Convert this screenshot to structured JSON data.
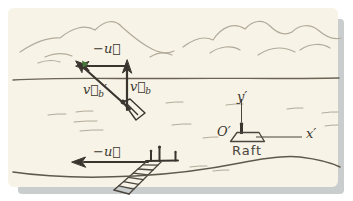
{
  "figure": {
    "colors": {
      "panel_bg": "#f7f3e7",
      "panel_shadow": "#c9cdcd",
      "ink_dark": "#3a362f",
      "ink_shore": "#6b6455",
      "ink_light": "#b3ab9a",
      "accent_green": "#47793b"
    }
  },
  "vector_triangle": {
    "neg_u_label": "−u⃗",
    "v_b_label_base": "v⃗",
    "v_b_label_sub": "b",
    "v_b_prime_label_base": "v⃗",
    "v_b_prime_label_sub": "b",
    "v_b_prime_label_prime": "′"
  },
  "dock": {
    "neg_u_label": "−u⃗"
  },
  "raft_frame": {
    "origin_label": "O′",
    "x_axis_label": "x′",
    "y_axis_label": "y′",
    "caption": "Raft"
  }
}
